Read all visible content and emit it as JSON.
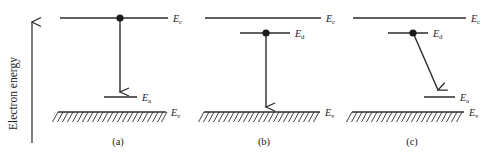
{
  "figure": {
    "axis": {
      "label": "Electron energy",
      "direction": "up",
      "arrow_icon": "up-arrow-icon"
    },
    "levels": {
      "conduction": "E",
      "conduction_sub": "c",
      "donor": "E",
      "donor_sub": "d",
      "acceptor": "E",
      "acceptor_sub": "a",
      "valence": "E",
      "valence_sub": "v"
    },
    "colors": {
      "ink": "#2b2b2b",
      "background": "#ffffff",
      "dot": "#1a1a1a"
    },
    "panels": [
      {
        "id": "panel-a",
        "caption": "(a)",
        "labels": {
          "top": "E",
          "top_sub": "c",
          "mid": "E",
          "mid_sub": "a",
          "bottom": "E",
          "bottom_sub": "v"
        },
        "electron_start_level": "conduction",
        "transition": "vertical",
        "transition_to": "acceptor"
      },
      {
        "id": "panel-b",
        "caption": "(b)",
        "labels": {
          "top": "E",
          "top_sub": "c",
          "mid": "E",
          "mid_sub": "d",
          "bottom": "E",
          "bottom_sub": "v"
        },
        "electron_start_level": "donor",
        "transition": "vertical",
        "transition_to": "valence"
      },
      {
        "id": "panel-c",
        "caption": "(c)",
        "labels": {
          "top": "E",
          "top_sub": "c",
          "mid": "E",
          "mid_sub": "d",
          "low": "E",
          "low_sub": "a",
          "bottom": "E",
          "bottom_sub": "v"
        },
        "electron_start_level": "donor",
        "transition": "diagonal",
        "transition_to": "acceptor"
      }
    ]
  }
}
